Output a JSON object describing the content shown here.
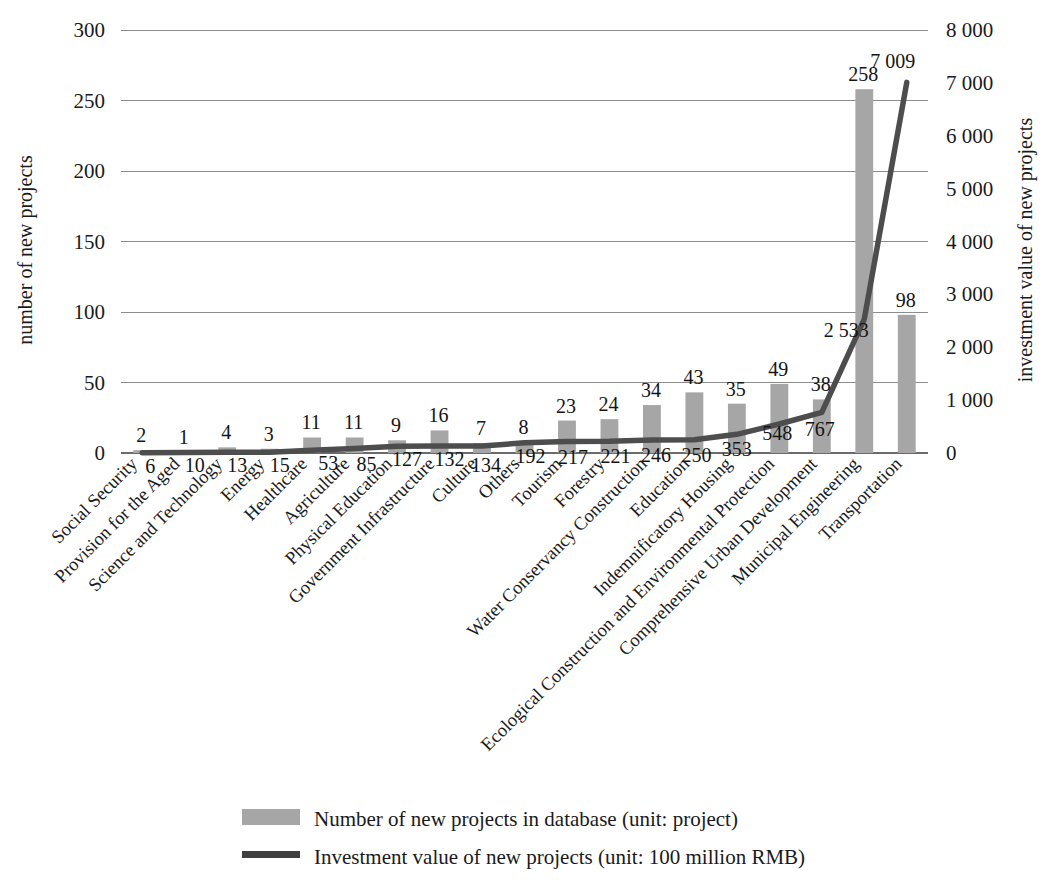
{
  "chart_data": {
    "type": "bar",
    "title": "",
    "subtitle": "",
    "xlabel": "",
    "ylabel": "number of new projects",
    "y2label": "investment value of new projects",
    "grid": true,
    "legend_position": "bottom",
    "ylim": [
      0,
      300
    ],
    "y2lim": [
      0,
      8000
    ],
    "yticks": [
      "0",
      "50",
      "100",
      "150",
      "200",
      "250",
      "300"
    ],
    "ytick_values": [
      0,
      50,
      100,
      150,
      200,
      250,
      300
    ],
    "y2ticks": [
      "0",
      "1 000",
      "2 000",
      "3 000",
      "4 000",
      "5 000",
      "6 000",
      "7 000",
      "8 000"
    ],
    "y2tick_values": [
      0,
      1000,
      2000,
      3000,
      4000,
      5000,
      6000,
      7000,
      8000
    ],
    "categories": [
      "Social Security",
      "Provision for the Aged",
      "Science and Technology",
      "Energy",
      "Healthcare",
      "Agriculture",
      "Physical Education",
      "Government Infrastructure",
      "Culture",
      "Others",
      "Tourism",
      "Forestry",
      "Water Conservancy Construction",
      "Education",
      "Indemnificatory Housing",
      "Ecological Construction and Environmental Protection",
      "Comprehensive Urban Development",
      "Municipal Engineering",
      "Transportation"
    ],
    "series": [
      {
        "name": "Number of new projects in database (unit: project)",
        "type": "bar",
        "axis": "left",
        "color": "#a6a6a6",
        "values": [
          2,
          1,
          4,
          3,
          11,
          11,
          9,
          16,
          7,
          8,
          23,
          24,
          34,
          43,
          35,
          49,
          38,
          258,
          98
        ],
        "labels": [
          "2",
          "1",
          "4",
          "3",
          "11",
          "11",
          "9",
          "16",
          "7",
          "8",
          "23",
          "24",
          "34",
          "43",
          "35",
          "49",
          "38",
          "258",
          "98"
        ]
      },
      {
        "name": "Investment value of new projects (unit: 100 million RMB)",
        "type": "line",
        "axis": "right",
        "color": "#4d4d4d",
        "values": [
          6,
          10,
          13,
          15,
          53,
          85,
          127,
          132,
          134,
          192,
          217,
          221,
          246,
          250,
          353,
          548,
          767,
          2533,
          7009
        ],
        "labels": [
          "6",
          "10",
          "13",
          "15",
          "53",
          "85",
          "127",
          "132",
          "134",
          "192",
          "217",
          "221",
          "246",
          "250",
          "353",
          "548",
          "767",
          "2 533",
          "7 009"
        ]
      }
    ]
  },
  "legend": {
    "items": [
      {
        "label": "Number of new projects in database (unit: project)",
        "marker": "bar-swatch",
        "color": "#a6a6a6"
      },
      {
        "label": "Investment value of new projects (unit: 100 million RMB)",
        "marker": "line-swatch",
        "color": "#3f3f3f"
      }
    ]
  },
  "colors": {
    "bar": "#a6a6a6",
    "line": "#4d4d4d",
    "grid": "#8c8c8c",
    "text": "#1a1a1a",
    "background": "#ffffff"
  }
}
